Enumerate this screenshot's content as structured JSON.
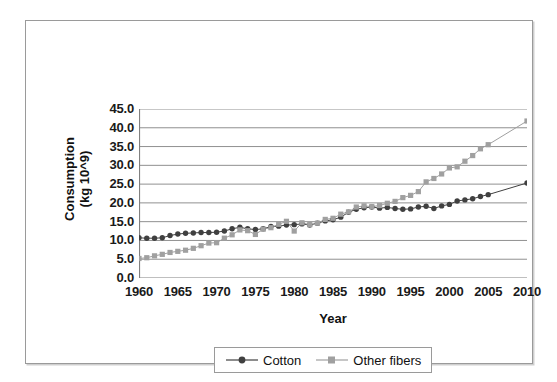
{
  "chart_data": {
    "type": "line",
    "title": "",
    "xlabel": "Year",
    "ylabel": "Consumption (kg 10^9)",
    "ylabel_lines": [
      "Consumption",
      "(kg 10^9)"
    ],
    "xlim": [
      1960,
      2010
    ],
    "ylim": [
      0.0,
      45.0
    ],
    "xticks": [
      1960,
      1965,
      1970,
      1975,
      1980,
      1985,
      1990,
      1995,
      2000,
      2005,
      2010
    ],
    "xtick_labels": [
      "1960",
      "1965",
      "1970",
      "1975",
      "1980",
      "1985",
      "1990",
      "1995",
      "2000",
      "2005",
      "2010"
    ],
    "yticks": [
      0.0,
      5.0,
      10.0,
      15.0,
      20.0,
      25.0,
      30.0,
      35.0,
      40.0,
      45.0
    ],
    "ytick_labels": [
      "0.0",
      "5.0",
      "10.0",
      "15.0",
      "20.0",
      "25.0",
      "30.0",
      "35.0",
      "40.0",
      "45.0"
    ],
    "grid": "horizontal",
    "legend_position": "bottom",
    "x": [
      1960,
      1961,
      1962,
      1963,
      1964,
      1965,
      1966,
      1967,
      1968,
      1969,
      1970,
      1971,
      1972,
      1973,
      1974,
      1975,
      1976,
      1977,
      1978,
      1979,
      1980,
      1981,
      1982,
      1983,
      1984,
      1985,
      1986,
      1987,
      1988,
      1989,
      1990,
      1991,
      1992,
      1993,
      1994,
      1995,
      1996,
      1997,
      1998,
      1999,
      2000,
      2001,
      2002,
      2003,
      2004,
      2005,
      2010
    ],
    "series": [
      {
        "name": "Cotton",
        "color": "#404040",
        "marker": "circle",
        "values": [
          10.7,
          10.6,
          10.6,
          10.7,
          11.3,
          11.7,
          11.9,
          12.0,
          12.1,
          12.1,
          12.2,
          12.5,
          13.1,
          13.5,
          13.1,
          12.9,
          13.1,
          13.7,
          13.8,
          14.1,
          14.2,
          14.4,
          14.1,
          14.6,
          15.2,
          15.5,
          16.2,
          17.5,
          18.3,
          18.7,
          18.9,
          18.6,
          18.8,
          18.5,
          18.3,
          18.4,
          18.9,
          19.1,
          18.5,
          19.2,
          19.6,
          20.5,
          20.8,
          21.1,
          21.7,
          22.2,
          25.3
        ]
      },
      {
        "name": "Other fibers",
        "color": "#a0a0a0",
        "marker": "square",
        "values": [
          5.2,
          5.4,
          5.9,
          6.3,
          6.8,
          7.1,
          7.4,
          7.9,
          8.6,
          9.3,
          9.4,
          10.6,
          11.5,
          12.8,
          12.6,
          11.6,
          13.0,
          13.4,
          14.3,
          15.1,
          12.5,
          14.7,
          14.2,
          14.6,
          15.6,
          15.9,
          17.0,
          17.6,
          18.9,
          19.2,
          19.0,
          19.3,
          19.9,
          20.4,
          21.4,
          22.0,
          23.0,
          25.6,
          26.5,
          27.7,
          29.3,
          29.6,
          31.1,
          32.6,
          34.4,
          35.5,
          41.8
        ]
      }
    ]
  },
  "legend": {
    "entries": [
      {
        "label": "Cotton"
      },
      {
        "label": "Other fibers"
      }
    ]
  }
}
